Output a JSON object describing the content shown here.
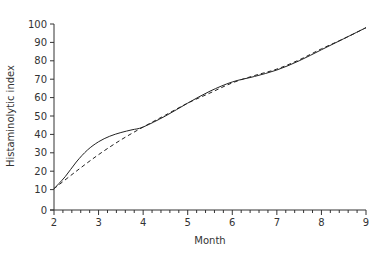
{
  "chart_data": {
    "type": "line",
    "title": "",
    "xlabel": "Month",
    "ylabel": "Histaminolytic index",
    "xlim": [
      2,
      9
    ],
    "ylim": [
      0,
      100
    ],
    "x_ticks": [
      2,
      3,
      4,
      5,
      6,
      7,
      8,
      9
    ],
    "x_minor_step": 0.2,
    "y_ticks": [
      0,
      10,
      20,
      30,
      40,
      50,
      60,
      70,
      80,
      90,
      100
    ],
    "grid": false,
    "legend": null,
    "series": [
      {
        "name": "observed",
        "style": "solid",
        "x": [
          2.0,
          2.25,
          2.5,
          2.75,
          3.0,
          3.25,
          3.5,
          3.75,
          4.0,
          4.5,
          5.0,
          5.5,
          6.0,
          6.5,
          7.0,
          7.5,
          8.0,
          8.5,
          9.0
        ],
        "y": [
          10.5,
          17,
          25,
          31.5,
          36,
          39,
          41,
          42.5,
          44,
          50,
          57,
          63.5,
          68.5,
          71.5,
          75,
          80,
          86,
          92,
          98
        ]
      },
      {
        "name": "fitted",
        "style": "dashed",
        "x": [
          2.0,
          2.5,
          3.0,
          3.5,
          4.0,
          4.5,
          5.0,
          5.5,
          6.0,
          6.5,
          7.0,
          7.5,
          8.0,
          8.5,
          9.0
        ],
        "y": [
          10.5,
          20,
          29,
          37,
          44,
          50.5,
          57,
          62.5,
          68,
          72,
          75.5,
          80.5,
          86.5,
          92,
          98
        ]
      }
    ]
  }
}
